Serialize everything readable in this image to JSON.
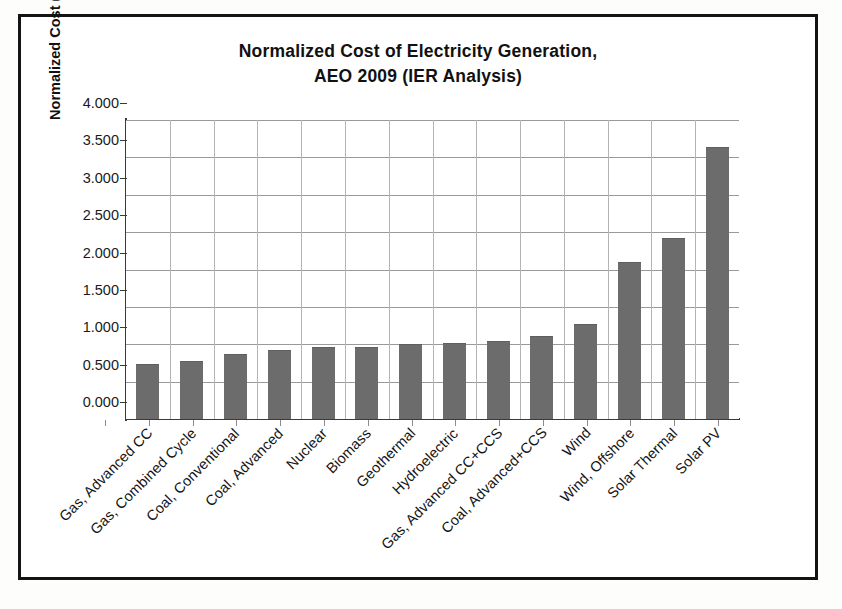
{
  "chart_data": {
    "type": "bar",
    "title": "Normalized Cost of Electricity Generation, AEO 2009 (IER Analysis)",
    "title_line1": "Normalized Cost of Electricity Generation,",
    "title_line2": "AEO 2009 (IER Analysis)",
    "xlabel": "",
    "ylabel": "Normalized Cost (Nuclear = 1)",
    "ylim": [
      0,
      4
    ],
    "ytick_step": 0.5,
    "ytick_labels": [
      "4.000",
      "3.500",
      "3.000",
      "2.500",
      "2.000",
      "1.500",
      "1.000",
      "0.500",
      "0.000"
    ],
    "ytick_values": [
      4.0,
      3.5,
      3.0,
      2.5,
      2.0,
      1.5,
      1.0,
      0.5,
      0.0
    ],
    "grid": true,
    "grid_orientation": "both",
    "legend": false,
    "bar_color": "#6c6c6c",
    "categories": [
      "Gas, Advanced CC",
      "Gas, Combined Cycle",
      "Coal, Conventional",
      "Coal, Advanced",
      "Nuclear",
      "Biomass",
      "Geothermal",
      "Hydroelectric",
      "Gas, Advanced CC+CCS",
      "Coal, Advanced+CCS",
      "Wind",
      "Wind, Offshore",
      "Solar Thermal",
      "Solar PV"
    ],
    "values": [
      0.73,
      0.77,
      0.87,
      0.93,
      0.97,
      0.97,
      1.01,
      1.02,
      1.05,
      1.11,
      1.27,
      2.1,
      2.42,
      3.64
    ],
    "series": [
      {
        "name": "Normalized Cost (Nuclear = 1)",
        "values": [
          0.73,
          0.77,
          0.87,
          0.93,
          0.97,
          0.97,
          1.01,
          1.02,
          1.05,
          1.11,
          1.27,
          2.1,
          2.42,
          3.64
        ]
      }
    ]
  }
}
